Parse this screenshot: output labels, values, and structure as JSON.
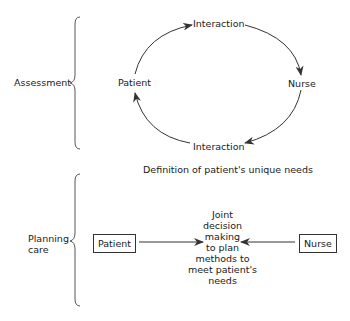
{
  "diagram": {
    "sections": [
      {
        "id": "assessment",
        "label": "Assessment"
      },
      {
        "id": "planning",
        "label": "Planning care"
      }
    ],
    "cycle": {
      "nodes": {
        "top": "Interaction",
        "right": "Nurse",
        "bottom": "Interaction",
        "left": "Patient"
      },
      "direction": "clockwise"
    },
    "definition_caption": "Definition of patient's unique needs",
    "planning": {
      "left_box": "Patient",
      "right_box": "Nurse",
      "center_lines": [
        "Joint",
        "decision",
        "making",
        "to plan",
        "methods to",
        "meet patient's",
        "needs"
      ]
    },
    "colors": {
      "line": "#333333",
      "text": "#1a1a1a",
      "background": "#ffffff"
    }
  }
}
